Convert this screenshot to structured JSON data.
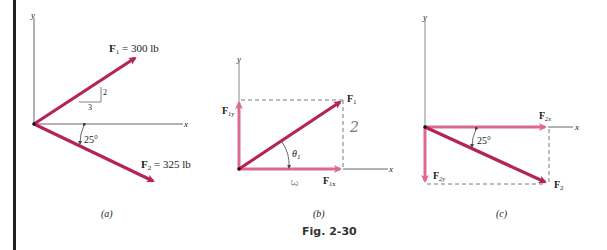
{
  "figure": {
    "caption": "Fig. 2-30",
    "colors": {
      "force": "#b3245a",
      "component": "#dc6a90",
      "axis": "#666666",
      "dashed": "#555555",
      "border": "#222222"
    }
  },
  "panels": {
    "a": {
      "label": "(a)",
      "axis_x": "x",
      "axis_y": "y",
      "F1": {
        "name": "F",
        "sub": "1",
        "value": " = 300 lb"
      },
      "F2": {
        "name": "F",
        "sub": "2",
        "value": " = 325 lb"
      },
      "slope_rise": "2",
      "slope_run": "3",
      "angle": "25°"
    },
    "b": {
      "label": "(b)",
      "axis_x": "x",
      "axis_y": "y",
      "F1": {
        "name": "F",
        "sub": "1"
      },
      "F1x": {
        "name": "F",
        "sub": "1x"
      },
      "F1y": {
        "name": "F",
        "sub": "1y"
      },
      "theta": {
        "name": "θ",
        "sub": "1"
      },
      "hand_rise": "2",
      "hand_run": "3"
    },
    "c": {
      "label": "(c)",
      "axis_x": "x",
      "axis_y": "y",
      "F2": {
        "name": "F",
        "sub": "2"
      },
      "F2x": {
        "name": "F",
        "sub": "2x"
      },
      "F2y": {
        "name": "F",
        "sub": "2y"
      },
      "angle": "25°"
    }
  }
}
